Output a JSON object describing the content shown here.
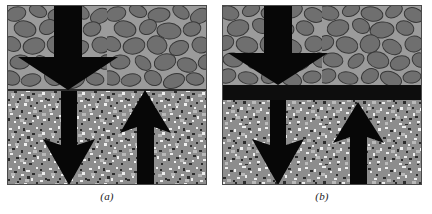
{
  "figure": {
    "width": 432,
    "height": 214,
    "background_color": "#ffffff",
    "panel_count": 2
  },
  "panels": [
    {
      "id": "panel-a",
      "caption": "(a)",
      "description": "Aggregate base course over subgrade soil without a geotextile separator",
      "x": 7,
      "y": 5,
      "width": 200,
      "height": 180,
      "layers": [
        {
          "name": "aggregate-gravel-layer",
          "label": "gravel",
          "top": 0,
          "height": 85,
          "matrix_color": "#9b9b9b",
          "stone_color": "#6f6f6f",
          "stone_outline_color": "#3a3a3a"
        },
        {
          "name": "subgrade-soil-layer",
          "label": "soil",
          "top": 85,
          "height": 95,
          "base_color": "#8d8d8d",
          "speckle_light_color": "#efefef",
          "speckle_dark_color": "#2a2a2a"
        }
      ],
      "separator": {
        "present": false,
        "name": "geotextile-separator",
        "color": "#0d0d0d",
        "thickness": 0
      },
      "interface_line": {
        "present": true,
        "color": "#2b2b2b",
        "thickness": 2
      },
      "arrows": [
        {
          "name": "upper-downward-load-arrow",
          "direction": "down",
          "region": "gravel",
          "color": "#070707",
          "shaft_x": 47,
          "shaft_width": 28,
          "shaft_top": 0,
          "head_top": 52,
          "head_half_width": 36,
          "tip_y": 85
        },
        {
          "name": "lower-downward-intrusion-arrow",
          "direction": "down",
          "region": "soil",
          "color": "#070707",
          "shaft_x": 54,
          "shaft_width": 16,
          "shaft_top": 85,
          "head_top": 140,
          "head_half_width": 26,
          "tip_y": 180
        },
        {
          "name": "lower-upward-pumping-arrow",
          "direction": "up",
          "region": "soil",
          "color": "#070707",
          "shaft_x": 130,
          "shaft_width": 17,
          "shaft_bottom": 180,
          "head_bottom": 122,
          "head_half_width": 26,
          "tip_y": 85
        }
      ]
    },
    {
      "id": "panel-b",
      "caption": "(b)",
      "description": "Aggregate base course over subgrade soil with a geotextile separator at the interface",
      "x": 222,
      "y": 5,
      "width": 200,
      "height": 180,
      "layers": [
        {
          "name": "aggregate-gravel-layer",
          "label": "gravel",
          "top": 0,
          "height": 80,
          "matrix_color": "#9b9b9b",
          "stone_color": "#6f6f6f",
          "stone_outline_color": "#3a3a3a"
        },
        {
          "name": "subgrade-soil-layer",
          "label": "soil",
          "top": 95,
          "height": 85,
          "base_color": "#8d8d8d",
          "speckle_light_color": "#efefef",
          "speckle_dark_color": "#2a2a2a"
        }
      ],
      "separator": {
        "present": true,
        "name": "geotextile-separator",
        "color": "#0d0d0d",
        "top": 80,
        "thickness": 15
      },
      "interface_line": {
        "present": false,
        "color": "#2b2b2b",
        "thickness": 0
      },
      "arrows": [
        {
          "name": "upper-downward-load-arrow",
          "direction": "down",
          "region": "gravel",
          "color": "#070707",
          "shaft_x": 42,
          "shaft_width": 28,
          "shaft_top": 0,
          "head_top": 48,
          "head_half_width": 36,
          "tip_y": 80
        },
        {
          "name": "lower-downward-intrusion-arrow",
          "direction": "down",
          "region": "soil",
          "color": "#070707",
          "shaft_x": 48,
          "shaft_width": 16,
          "shaft_top": 95,
          "head_top": 140,
          "head_half_width": 26,
          "tip_y": 180
        },
        {
          "name": "lower-upward-pumping-arrow",
          "direction": "up",
          "region": "soil",
          "color": "#070707",
          "shaft_x": 128,
          "shaft_width": 17,
          "shaft_bottom": 180,
          "head_bottom": 132,
          "head_half_width": 26,
          "tip_y": 97
        }
      ]
    }
  ],
  "colors": {
    "background": "#ffffff",
    "arrow_black": "#070707",
    "geotextile_black": "#0d0d0d",
    "gravel_matrix": "#9b9b9b",
    "gravel_stone": "#6f6f6f",
    "soil_base": "#8d8d8d",
    "caption_text": "#1a1a1a"
  }
}
